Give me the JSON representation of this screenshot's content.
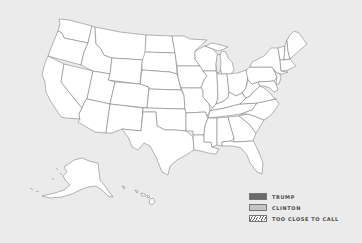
{
  "map": {
    "title": "US Presidential Election Map",
    "background_color": "#ebebeb",
    "state_fill": "#ffffff",
    "state_stroke": "#6e6e6e",
    "regions": [
      "contiguous-us",
      "alaska",
      "hawaii"
    ]
  },
  "legend": {
    "items": [
      {
        "label": "TRUMP",
        "color": "#6a6a6a",
        "pattern": "solid"
      },
      {
        "label": "CLINTON",
        "color": "#c4c4c4",
        "pattern": "solid"
      },
      {
        "label": "TOO CLOSE TO CALL",
        "color": "#6a6a6a",
        "pattern": "hatched"
      }
    ]
  }
}
